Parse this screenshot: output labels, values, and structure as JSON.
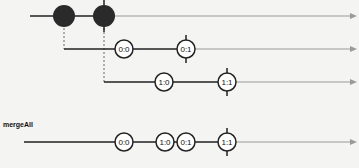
{
  "diagram": {
    "type": "marble",
    "operator_label": "mergeAll",
    "colors": {
      "active_line": "#222222",
      "inactive_line": "#9a9a9a",
      "marble_fill": "#2a2a2a",
      "inner_fill": "#ffffff",
      "background": "#f4f4f2"
    },
    "outer": {
      "y": 16,
      "start_x": 30,
      "emissions": [
        {
          "x": 64
        },
        {
          "x": 104,
          "complete": true
        }
      ]
    },
    "inner": [
      {
        "y": 49,
        "start_x": 64,
        "marbles": [
          {
            "x": 124,
            "label": "0:0"
          },
          {
            "x": 186,
            "label": "0:1",
            "complete": true
          }
        ]
      },
      {
        "y": 82,
        "start_x": 104,
        "marbles": [
          {
            "x": 164,
            "label": "1:0"
          },
          {
            "x": 227,
            "label": "1:1",
            "complete": true
          }
        ]
      }
    ],
    "output": {
      "y": 142,
      "start_x": 24,
      "marbles": [
        {
          "x": 124,
          "label": "0:0"
        },
        {
          "x": 165,
          "label": "1:0"
        },
        {
          "x": 186,
          "label": "0:1"
        },
        {
          "x": 227,
          "label": "1:1",
          "complete": true
        }
      ]
    }
  }
}
